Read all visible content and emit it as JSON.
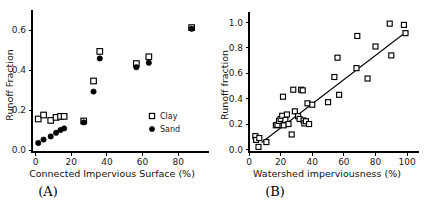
{
  "figure": {
    "background": "#ffffff",
    "marker_color": "#000000",
    "panels": [
      "A",
      "B"
    ]
  },
  "panel_a": {
    "label": "(A)",
    "legend": [
      {
        "name": "Clay",
        "marker": "open-square-marker"
      },
      {
        "name": "Sand",
        "marker": "filled-circle-marker"
      }
    ]
  },
  "panel_b": {
    "label": "(B)"
  },
  "chart_data": [
    {
      "type": "scatter",
      "panel": "A",
      "title": "",
      "xlabel": "Connected Impervious Surface (%)",
      "ylabel": "Runoff Fraction",
      "xlim": [
        -2,
        95
      ],
      "ylim": [
        -0.01,
        0.68
      ],
      "xticks": [
        0,
        20,
        40,
        60,
        80
      ],
      "yticks": [
        0.0,
        0.2,
        0.4,
        0.6
      ],
      "xticklabels": [
        "0",
        "20",
        "40",
        "60",
        "80"
      ],
      "yticklabels": [
        "0.0",
        "0.2",
        "0.4",
        "0.6"
      ],
      "grid": false,
      "legend_position": "lower-right",
      "series": [
        {
          "name": "Clay",
          "marker": "open-square",
          "points": [
            [
              1.5,
              0.155
            ],
            [
              4.5,
              0.175
            ],
            [
              8.5,
              0.148
            ],
            [
              11.5,
              0.163
            ],
            [
              14.0,
              0.168
            ],
            [
              16.0,
              0.168
            ],
            [
              27.0,
              0.145
            ],
            [
              32.5,
              0.345
            ],
            [
              36.0,
              0.493
            ],
            [
              56.5,
              0.432
            ],
            [
              63.5,
              0.466
            ],
            [
              87.5,
              0.612
            ]
          ]
        },
        {
          "name": "Sand",
          "marker": "filled-circle",
          "points": [
            [
              1.5,
              0.035
            ],
            [
              4.5,
              0.052
            ],
            [
              8.5,
              0.068
            ],
            [
              11.5,
              0.086
            ],
            [
              14.0,
              0.1
            ],
            [
              16.0,
              0.108
            ],
            [
              27.0,
              0.138
            ],
            [
              32.5,
              0.292
            ],
            [
              36.0,
              0.458
            ],
            [
              56.5,
              0.414
            ],
            [
              63.5,
              0.436
            ],
            [
              87.5,
              0.606
            ]
          ]
        }
      ]
    },
    {
      "type": "scatter",
      "panel": "B",
      "title": "",
      "xlabel": "Watershed imperviousness (%)",
      "ylabel": "Runoff fraction",
      "xlim": [
        0,
        105
      ],
      "ylim": [
        -0.02,
        1.05
      ],
      "xticks": [
        0,
        20,
        40,
        60,
        80,
        100
      ],
      "yticks": [
        0.0,
        0.2,
        0.4,
        0.6,
        0.8,
        1.0
      ],
      "xticklabels": [
        "0",
        "20",
        "40",
        "60",
        "80",
        "100"
      ],
      "yticklabels": [
        "0.0",
        "0.2",
        "0.4",
        "0.6",
        "0.8",
        "1.0"
      ],
      "grid": false,
      "legend_position": "none",
      "series": [
        {
          "name": "Watersheds",
          "marker": "open-square",
          "points": [
            [
              4.0,
              0.105
            ],
            [
              4.5,
              0.075
            ],
            [
              6.0,
              0.02
            ],
            [
              6.5,
              0.09
            ],
            [
              11.0,
              0.058
            ],
            [
              17.0,
              0.19
            ],
            [
              18.0,
              0.193
            ],
            [
              19.0,
              0.225
            ],
            [
              20.0,
              0.24
            ],
            [
              21.0,
              0.265
            ],
            [
              21.5,
              0.415
            ],
            [
              22.0,
              0.19
            ],
            [
              23.0,
              0.232
            ],
            [
              24.0,
              0.275
            ],
            [
              25.0,
              0.2
            ],
            [
              27.0,
              0.118
            ],
            [
              28.0,
              0.47
            ],
            [
              29.0,
              0.3
            ],
            [
              31.0,
              0.262
            ],
            [
              32.0,
              0.24
            ],
            [
              33.0,
              0.47
            ],
            [
              34.0,
              0.465
            ],
            [
              34.5,
              0.228
            ],
            [
              35.0,
              0.205
            ],
            [
              36.0,
              0.222
            ],
            [
              37.0,
              0.363
            ],
            [
              38.0,
              0.2
            ],
            [
              40.0,
              0.352
            ],
            [
              50.0,
              0.372
            ],
            [
              54.0,
              0.57
            ],
            [
              56.0,
              0.722
            ],
            [
              57.0,
              0.43
            ],
            [
              68.0,
              0.64
            ],
            [
              68.5,
              0.893
            ],
            [
              75.0,
              0.558
            ],
            [
              80.0,
              0.81
            ],
            [
              89.0,
              0.99
            ],
            [
              90.0,
              0.74
            ],
            [
              98.0,
              0.98
            ],
            [
              99.0,
              0.915
            ]
          ]
        }
      ],
      "fit_line": {
        "name": "regression-line",
        "x": [
          8.0,
          100.0
        ],
        "y": [
          0.055,
          0.93
        ]
      }
    }
  ]
}
